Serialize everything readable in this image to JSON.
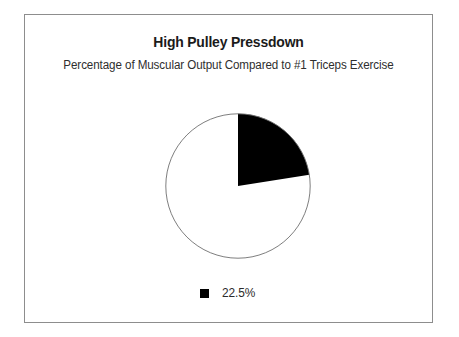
{
  "figure": {
    "title": "High Pulley Pressdown",
    "subtitle": "Percentage of Muscular Output Compared to #1 Triceps Exercise",
    "border_color": "#8d8d8d",
    "background_color": "#ffffff"
  },
  "legend": {
    "items": [
      {
        "label": "22.5%",
        "color": "#000000",
        "marker": "filled-square"
      }
    ]
  },
  "chart_data": {
    "type": "pie",
    "title": "High Pulley Pressdown",
    "subtitle": "Percentage of Muscular Output Compared to #1 Triceps Exercise",
    "xlabel": "",
    "ylabel": "",
    "start_angle_deg": 0,
    "direction": "clockwise",
    "legend_position": "bottom",
    "grid": false,
    "slices": [
      {
        "label": "22.5%",
        "value": 22.5,
        "angle_deg": 81,
        "color": "#000000",
        "in_legend": true
      },
      {
        "label": "",
        "value": 77.5,
        "angle_deg": 279,
        "color": "#ffffff",
        "in_legend": false
      }
    ],
    "categories": [
      "22.5%",
      ""
    ],
    "values": [
      22.5,
      77.5
    ],
    "outline_color": "#6f6f6f"
  }
}
